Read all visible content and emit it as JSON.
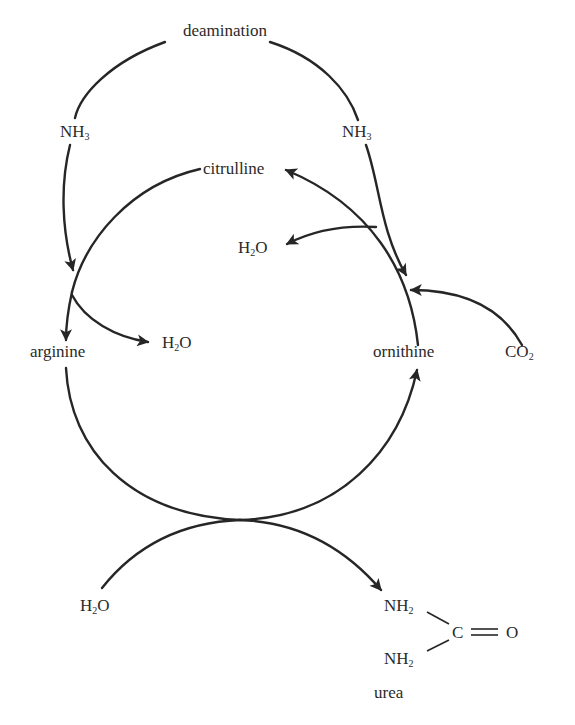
{
  "diagram": {
    "labels": {
      "deamination": "deamination",
      "nh3_left": "NH",
      "nh3_left_sub": "3",
      "nh3_right": "NH",
      "nh3_right_sub": "3",
      "citrulline": "citrulline",
      "h2o_top": "H",
      "h2o_top_sub": "2",
      "h2o_top_o": "O",
      "arginine": "arginine",
      "h2o_mid": "H",
      "h2o_mid_sub": "2",
      "h2o_mid_o": "O",
      "ornithine": "ornithine",
      "co2": "CO",
      "co2_sub": "2",
      "h2o_bottom": "H",
      "h2o_bottom_sub": "2",
      "h2o_bottom_o": "O",
      "urea_nh2_top": "NH",
      "urea_nh2_top_sub": "2",
      "urea_nh2_bottom": "NH",
      "urea_nh2_bottom_sub": "2",
      "urea_c": "C",
      "urea_o": "O",
      "urea": "urea"
    },
    "nodes": [
      "deamination",
      "NH3",
      "NH3",
      "citrulline",
      "arginine",
      "ornithine",
      "H2O",
      "H2O",
      "H2O",
      "CO2",
      "urea"
    ],
    "edges": [
      {
        "from": "deamination",
        "to": "arginine",
        "via": "NH3"
      },
      {
        "from": "deamination",
        "to": "ornithine",
        "via": "NH3"
      },
      {
        "from": "ornithine",
        "to": "citrulline",
        "releases": "H2O",
        "consumes": "CO2"
      },
      {
        "from": "citrulline",
        "to": "arginine",
        "releases": "H2O"
      },
      {
        "from": "arginine",
        "to": "ornithine",
        "consumes": "H2O",
        "produces": "urea"
      }
    ],
    "colors": {
      "ink": "#262626",
      "background": "#ffffff"
    }
  }
}
